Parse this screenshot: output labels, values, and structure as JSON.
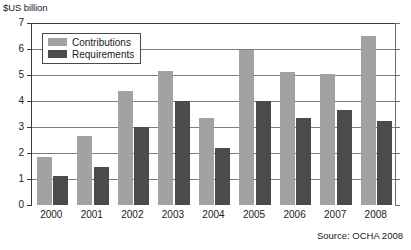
{
  "chart_data": {
    "type": "bar",
    "title": "",
    "ylabel": "$US billion",
    "xlabel": "",
    "ylim": [
      0,
      7
    ],
    "yticks": [
      0,
      1,
      2,
      3,
      4,
      5,
      6,
      7
    ],
    "ytick_labels": [
      "0",
      "1",
      "2",
      "3",
      "4",
      "5",
      "6",
      "7"
    ],
    "grid": true,
    "legend_position": "top-left",
    "categories": [
      "2000",
      "2001",
      "2002",
      "2003",
      "2004",
      "2005",
      "2006",
      "2007",
      "2008"
    ],
    "series": [
      {
        "name": "Contributions",
        "color": "#a2a2a2",
        "values": [
          1.85,
          2.65,
          4.4,
          5.15,
          3.35,
          5.95,
          5.1,
          5.05,
          6.5
        ]
      },
      {
        "name": "Requirements",
        "color": "#4b4b4b",
        "values": [
          1.1,
          1.45,
          3.0,
          4.0,
          2.2,
          4.0,
          3.35,
          3.65,
          3.25
        ]
      }
    ],
    "source": "Source: OCHA 2008"
  }
}
